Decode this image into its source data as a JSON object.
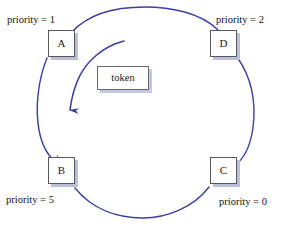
{
  "diagram": {
    "ring_color": "#3b3f9e",
    "box_border_color": "#575757",
    "shadow_color": "#b9c0d8",
    "background": "#ffffff",
    "nodes": [
      {
        "id": "A",
        "label": "A",
        "priority_label": "priority = 1",
        "x": 48,
        "y": 30
      },
      {
        "id": "D",
        "label": "D",
        "priority_label": "priority = 2",
        "x": 210,
        "y": 30
      },
      {
        "id": "B",
        "label": "B",
        "priority_label": "priority = 5",
        "x": 48,
        "y": 157
      },
      {
        "id": "C",
        "label": "C",
        "priority_label": "priority = 0",
        "x": 210,
        "y": 157
      }
    ],
    "token": {
      "label": "token",
      "x": 97,
      "y": 66
    },
    "direction_arrow": {
      "meaning": "token rotation direction, counter-clockwise toward B",
      "color": "#3b3f9e"
    },
    "labels": {
      "top_left": "priority = 1",
      "top_right": "priority = 2",
      "bottom_left": "priority = 5",
      "bottom_right": "priority = 0",
      "center": "token",
      "node_a": "A",
      "node_b": "B",
      "node_c": "C",
      "node_d": "D"
    }
  }
}
